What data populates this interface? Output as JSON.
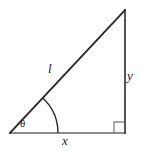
{
  "figure": {
    "type": "right-triangle-diagram",
    "labels": {
      "hypotenuse": "l",
      "opposite": "y",
      "adjacent": "x",
      "angle": "θ"
    },
    "colors": {
      "hypotenuse_stroke": "#2b2b2b",
      "vertical_stroke": "#2b2b2b",
      "base_stroke": "#8c8c8c",
      "arc_stroke": "#2b2b2b",
      "right_angle_stroke": "#8c8c8c",
      "background": "#ffffff",
      "label_color": "#1a1a1a"
    },
    "geometry": {
      "vertex_left": [
        10,
        133
      ],
      "vertex_right": [
        125,
        133
      ],
      "vertex_top": [
        125,
        10
      ],
      "arc_radius": 48,
      "right_angle_box_size": 11
    }
  }
}
